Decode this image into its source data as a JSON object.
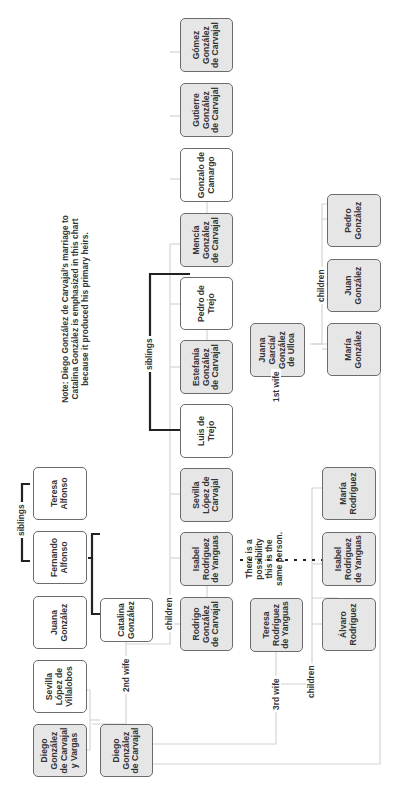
{
  "diagram": {
    "type": "family-tree",
    "orientation": "rotated-90-ccw",
    "note": "Note: Diego González de Carvajal's marriage to Catalina González is emphasized in this chart because it produced his primary heirs.",
    "possibility_note": "There is a possibility this is the same person.",
    "labels": {
      "siblings_top": "siblings",
      "siblings_trejo": "siblings",
      "first_wife": "1st wife",
      "second_wife": "2nd wife",
      "third_wife": "3rd wife",
      "children_first": "children",
      "children_second": "children",
      "children_third": "children"
    },
    "colors": {
      "highlighted_fill": "#e6e6e6",
      "plain_fill": "#ffffff",
      "border": "#6b6b6b",
      "emphasis_line": "#222222",
      "thin_line": "#d0d0d0"
    },
    "people": {
      "diego_vargas": "Diego González de Carvajal y Vargas",
      "sevilla_villalobos": "Sevilla López de Villalobos",
      "juana_gonzalez": "Juana González",
      "fernando_alfonso": "Fernando Alfonso",
      "teresa_alfonso": "Teresa Alfonso",
      "diego_carvajal": "Diego González de Carvajal",
      "catalina_gonzalez": "Catalina González",
      "rodrigo": "Rodrigo González de Carvajal",
      "isabel_rdy_1": "Isabel Rodríguez de Yanguas",
      "sevilla_carvajal": "Sevilla López de Carvajal",
      "luis_trejo": "Luis de Trejo",
      "estefania": "Estefanía González de Carvajal",
      "pedro_trejo": "Pedro de Trejo",
      "mencia": "Mencía González de Carvajal",
      "gonzalo_camargo": "Gonzalo de Camargo",
      "gutierre": "Gutierre González de Carvajal",
      "gomez": "Gómez González de Carvajal",
      "teresa_rdy": "Teresa Rodríguez de Yanguas",
      "juana_garcia": "Juana García/ González de Ulloa",
      "alvaro": "Álvaro Rodríguez",
      "isabel_rdy_2": "Isabel Rodríguez de Yanguas",
      "maria_rodriguez": "María Rodríguez",
      "maria_gonzalez": "María González",
      "juan_gonzalez": "Juan González",
      "pedro_gonzalez": "Pedro González"
    }
  }
}
